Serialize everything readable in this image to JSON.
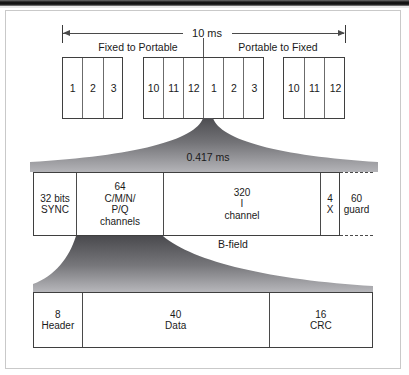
{
  "figure": {
    "timing": {
      "total_label": "10 ms",
      "direction_left": "Fixed to Portable",
      "direction_right": "Portable to Fixed"
    },
    "slot_groups": [
      {
        "name": "fixed-to-portable-start",
        "slots": [
          "1",
          "2",
          "3"
        ]
      },
      {
        "name": "frame-boundary",
        "slots": [
          "10",
          "11",
          "12",
          "1",
          "2",
          "3"
        ]
      },
      {
        "name": "portable-to-fixed-end",
        "slots": [
          "10",
          "11",
          "12"
        ]
      }
    ],
    "burst": {
      "duration_label": "0.417 ms",
      "cells": [
        {
          "name": "sync-field",
          "top": "32 bits",
          "lines": [
            "SYNC"
          ]
        },
        {
          "name": "a-field",
          "top": "64",
          "lines": [
            "C/M/N/",
            "P/Q",
            "channels"
          ]
        },
        {
          "name": "b-field",
          "top": "320",
          "lines": [
            "I",
            "channel"
          ]
        },
        {
          "name": "x-field",
          "top": "4",
          "lines": [
            "X"
          ]
        }
      ],
      "guard": {
        "top": "60",
        "lines": [
          "guard"
        ]
      },
      "field_labels": {
        "a": "A-field",
        "b": "B-field"
      }
    },
    "packet": {
      "cells": [
        {
          "name": "header",
          "top": "8",
          "label": "Header"
        },
        {
          "name": "data",
          "top": "40",
          "label": "Data"
        },
        {
          "name": "crc",
          "top": "16",
          "label": "CRC"
        }
      ]
    },
    "colors": {
      "ink": "#1a1a1a",
      "rule": "#3f3f3f",
      "funnel_dark": "#56565a",
      "funnel_light": "#b9b9bd",
      "frame_border": "#c9c9c9"
    }
  }
}
